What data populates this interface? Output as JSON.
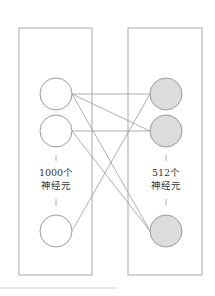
{
  "diagram": {
    "type": "fully-connected-layer",
    "colors": {
      "frame": "#a9a9a9",
      "edge": "#9a9a9a",
      "input_fill": "#ffffff",
      "output_fill": "#dcdcdc",
      "node_stroke": "#9a9a9a",
      "text": "#333333",
      "footer_line": "#d0d0d0"
    },
    "layers": [
      {
        "id": "input",
        "count_label": "1000个",
        "unit_label": "神经元",
        "visible_nodes": 3
      },
      {
        "id": "output",
        "count_label": "512个",
        "unit_label": "神经元",
        "visible_nodes": 3
      }
    ],
    "edges": [
      {
        "from": 0,
        "to": 0
      },
      {
        "from": 0,
        "to": 1
      },
      {
        "from": 0,
        "to": 2
      },
      {
        "from": 1,
        "to": 1
      },
      {
        "from": 1,
        "to": 2
      },
      {
        "from": 2,
        "to": 0
      }
    ]
  }
}
